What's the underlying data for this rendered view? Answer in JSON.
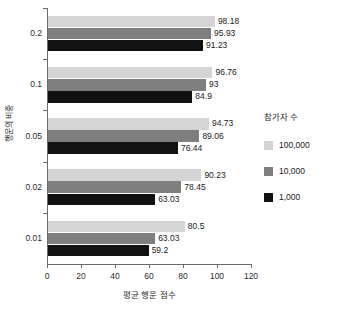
{
  "chart_data": {
    "type": "bar",
    "orientation": "horizontal",
    "title": "",
    "xlabel": "평균 행운 점수",
    "ylabel": "행운의 비중",
    "categories": [
      "0.2",
      "0.1",
      "0.05",
      "0.02",
      "0.01"
    ],
    "series": [
      {
        "name": "100,000",
        "color": "#d4d4d4",
        "values": [
          98.18,
          95.93,
          94.73,
          90.23,
          80.5
        ],
        "labels": [
          "98.18",
          "95.93",
          "94.73",
          "90.23",
          "80.5"
        ]
      },
      {
        "name": "10,000",
        "color": "#7f7f7f",
        "values": [
          95.93,
          93,
          89.06,
          78.45,
          63.03
        ],
        "labels": [
          "95.93",
          "93",
          "89.06",
          "78.45",
          "63.03"
        ]
      },
      {
        "name": "1,000",
        "color": "#111111",
        "values": [
          91.23,
          84.9,
          76.44,
          63.03,
          59.2
        ],
        "labels": [
          "91.23",
          "84.9",
          "76.44",
          "63.03",
          "59.2"
        ]
      }
    ],
    "group_values": {
      "0.2": {
        "s100000": "98.18",
        "s10000": "95.93",
        "s1000": "91.23"
      },
      "0.1": {
        "s100000": "96.76",
        "s10000": "93",
        "s1000": "84.9"
      },
      "0.05": {
        "s100000": "94.73",
        "s10000": "89.06",
        "s1000": "76.44"
      },
      "0.02": {
        "s100000": "90.23",
        "s10000": "78.45",
        "s1000": "63.03"
      },
      "0.01": {
        "s100000": "80.5",
        "s10000": "63.03",
        "s1000": "59.2"
      }
    },
    "xlim": [
      0,
      120
    ],
    "xticks": [
      "0",
      "20",
      "40",
      "60",
      "80",
      "100",
      "120"
    ],
    "grid": false,
    "legend": {
      "title": "참가자 수",
      "position": "right",
      "entries": [
        {
          "label": "100,000",
          "color": "#d4d4d4"
        },
        {
          "label": "10,000",
          "color": "#7f7f7f"
        },
        {
          "label": "1,000",
          "color": "#111111"
        }
      ]
    }
  },
  "bars": [
    {
      "group": "0.2",
      "series": "100,000",
      "value": 98.18,
      "label": "98.18",
      "color": "#d4d4d4"
    },
    {
      "group": "0.2",
      "series": "10,000",
      "value": 95.93,
      "label": "95.93",
      "color": "#7f7f7f"
    },
    {
      "group": "0.2",
      "series": "1,000",
      "value": 91.23,
      "label": "91.23",
      "color": "#111111"
    },
    {
      "group": "0.1",
      "series": "100,000",
      "value": 96.76,
      "label": "96.76",
      "color": "#d4d4d4"
    },
    {
      "group": "0.1",
      "series": "10,000",
      "value": 93,
      "label": "93",
      "color": "#7f7f7f"
    },
    {
      "group": "0.1",
      "series": "1,000",
      "value": 84.9,
      "label": "84.9",
      "color": "#111111"
    },
    {
      "group": "0.05",
      "series": "100,000",
      "value": 94.73,
      "label": "94.73",
      "color": "#d4d4d4"
    },
    {
      "group": "0.05",
      "series": "10,000",
      "value": 89.06,
      "label": "89.06",
      "color": "#7f7f7f"
    },
    {
      "group": "0.05",
      "series": "1,000",
      "value": 76.44,
      "label": "76.44",
      "color": "#111111"
    },
    {
      "group": "0.02",
      "series": "100,000",
      "value": 90.23,
      "label": "90.23",
      "color": "#d4d4d4"
    },
    {
      "group": "0.02",
      "series": "10,000",
      "value": 78.45,
      "label": "78.45",
      "color": "#7f7f7f"
    },
    {
      "group": "0.02",
      "series": "1,000",
      "value": 63.03,
      "label": "63.03",
      "color": "#111111"
    },
    {
      "group": "0.01",
      "series": "100,000",
      "value": 80.5,
      "label": "80.5",
      "color": "#d4d4d4"
    },
    {
      "group": "0.01",
      "series": "10,000",
      "value": 63.03,
      "label": "63.03",
      "color": "#7f7f7f"
    },
    {
      "group": "0.01",
      "series": "1,000",
      "value": 59.2,
      "label": "59.2",
      "color": "#111111"
    }
  ]
}
